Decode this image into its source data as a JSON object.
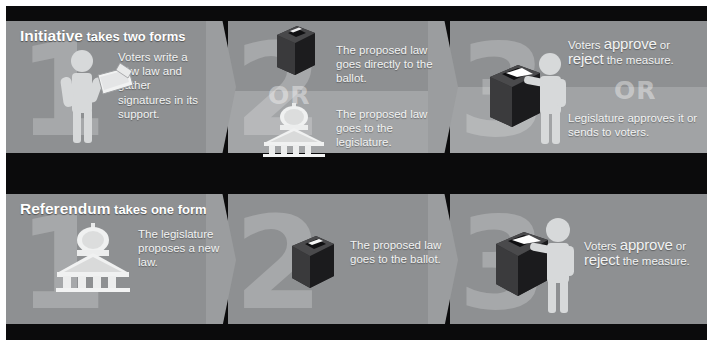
{
  "colors": {
    "background": "#ffffff",
    "board": "#0b0b0c",
    "panel": "#8e9092",
    "panel_light": "#a3a5a7",
    "chevron": "#9b9d9f",
    "text": "#f2f3f3",
    "ghost_numeral": "rgba(255,255,255,0.22)"
  },
  "sections": [
    {
      "id": "initiative",
      "heading_strong": "Initiative",
      "heading_rest": " takes two forms",
      "steps": [
        {
          "number": "1",
          "icon": "person-writing-petition-icon",
          "blocks": [
            {
              "text": "Voters write a new law and gather signatures in its support."
            }
          ]
        },
        {
          "number": "2",
          "or_label": "OR",
          "blocks": [
            {
              "icon": "ballot-box-icon",
              "text": "The proposed law goes directly to the ballot."
            },
            {
              "icon": "capitol-building-icon",
              "text": "The proposed law goes to the legislature."
            }
          ]
        },
        {
          "number": "3",
          "or_label": "OR",
          "blocks": [
            {
              "icon": "voter-casting-ballot-icon",
              "lead": "Voters ",
              "emphasis_1": "approve",
              "mid": " or ",
              "emphasis_2": "reject",
              "tail": " the measure."
            },
            {
              "text": "Legislature approves it or sends to voters."
            }
          ]
        }
      ]
    },
    {
      "id": "referendum",
      "heading_strong": "Referendum",
      "heading_rest": " takes one form",
      "steps": [
        {
          "number": "1",
          "icon": "capitol-building-icon",
          "blocks": [
            {
              "text": "The legislature proposes a new law."
            }
          ]
        },
        {
          "number": "2",
          "icon": "ballot-box-icon",
          "blocks": [
            {
              "text": "The proposed law goes to the ballot."
            }
          ]
        },
        {
          "number": "3",
          "icon": "voter-casting-ballot-icon",
          "blocks": [
            {
              "lead": "Voters ",
              "emphasis_1": "approve",
              "mid": " or ",
              "emphasis_2": "reject",
              "tail": " the measure."
            }
          ]
        }
      ]
    }
  ]
}
